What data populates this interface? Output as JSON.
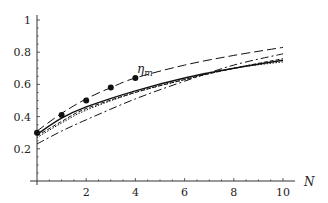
{
  "chart_data": {
    "type": "line",
    "title": "",
    "annotation": "η_m",
    "xlabel": "N",
    "ylabel": "",
    "xlim": [
      0,
      10
    ],
    "ylim": [
      0,
      1
    ],
    "x_ticks": [
      "2",
      "4",
      "6",
      "8",
      "10"
    ],
    "y_ticks": [
      "0.2",
      "0.4",
      "0.6",
      "0.8",
      "1"
    ],
    "grid": false,
    "series": [
      {
        "name": "data points",
        "style": "markers",
        "x": [
          0,
          1,
          2,
          3,
          4
        ],
        "y": [
          0.3,
          0.41,
          0.5,
          0.58,
          0.64
        ]
      },
      {
        "name": "long-dash",
        "style": "long-dash",
        "x": [
          0,
          1,
          2,
          3,
          4,
          6,
          8,
          10
        ],
        "y": [
          0.31,
          0.42,
          0.51,
          0.58,
          0.64,
          0.72,
          0.78,
          0.83
        ]
      },
      {
        "name": "dash-dot",
        "style": "dash-dot",
        "x": [
          0,
          1,
          2,
          4,
          6,
          8,
          10
        ],
        "y": [
          0.23,
          0.31,
          0.38,
          0.51,
          0.62,
          0.72,
          0.79
        ]
      },
      {
        "name": "solid",
        "style": "solid",
        "x": [
          0,
          1,
          2,
          4,
          6,
          8,
          10
        ],
        "y": [
          0.29,
          0.39,
          0.46,
          0.56,
          0.64,
          0.7,
          0.75
        ]
      },
      {
        "name": "dotted",
        "style": "dotted",
        "x": [
          0,
          1,
          2,
          4,
          6,
          8,
          10
        ],
        "y": [
          0.27,
          0.36,
          0.44,
          0.55,
          0.63,
          0.7,
          0.74
        ]
      },
      {
        "name": "short-dash",
        "style": "short-dash",
        "x": [
          0,
          1,
          2,
          4,
          6,
          8,
          10
        ],
        "y": [
          0.28,
          0.37,
          0.45,
          0.55,
          0.63,
          0.7,
          0.76
        ]
      }
    ]
  }
}
